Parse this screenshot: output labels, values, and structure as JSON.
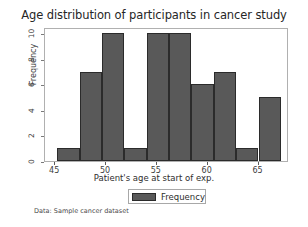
{
  "chart_data": {
    "type": "bar",
    "title": "Age distribution of participants in cancer study",
    "xlabel": "Patient's age at start of exp.",
    "ylabel": "Frequency",
    "xlim": [
      44.0,
      68.0
    ],
    "ylim": [
      0,
      10.5
    ],
    "xticks": [
      45,
      50,
      55,
      60,
      65
    ],
    "yticks": [
      0,
      2,
      4,
      6,
      8,
      10
    ],
    "grid": false,
    "legend": {
      "position": "below-axes-center",
      "entries": [
        "Frequency"
      ]
    },
    "bar_color": "#595959",
    "bar_edge_color": "#2b2b2b",
    "bin_edges": [
      45.2,
      47.4,
      49.6,
      51.8,
      54.0,
      56.2,
      58.4,
      60.6,
      62.8,
      65.0,
      67.2
    ],
    "bin_centers": [
      46.3,
      48.5,
      50.7,
      52.9,
      55.1,
      57.3,
      59.5,
      61.7,
      63.9,
      66.1
    ],
    "values": [
      1,
      7,
      10,
      1,
      10,
      6,
      7,
      1,
      5
    ],
    "bars": [
      {
        "bin": "45.2-47.4",
        "value": 1
      },
      {
        "bin": "47.4-49.6",
        "value": 7
      },
      {
        "bin": "49.6-51.8",
        "value": 10
      },
      {
        "bin": "51.8-54.0",
        "value": 1
      },
      {
        "bin": "54.0-56.2",
        "value": 10
      },
      {
        "bin": "56.2-58.4",
        "value": 10
      },
      {
        "bin": "58.4-60.6",
        "value": 6
      },
      {
        "bin": "60.6-62.8",
        "value": 7
      },
      {
        "bin": "62.8-65.0",
        "value": 1
      },
      {
        "bin": "65.0-67.2",
        "value": 5
      }
    ],
    "annotations": [
      "Data: Sample cancer dataset"
    ]
  },
  "figure": {
    "title": "Age distribution of participants in cancer study",
    "xlabel": "Patient's age at start of exp.",
    "ylabel": "Frequency",
    "footer": "Data: Sample cancer dataset",
    "legend_label": "Frequency",
    "xtick_labels": [
      "45",
      "50",
      "55",
      "60",
      "65"
    ],
    "ytick_labels": [
      "0",
      "2",
      "4",
      "6",
      "8",
      "10"
    ]
  }
}
